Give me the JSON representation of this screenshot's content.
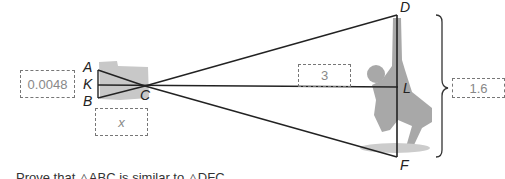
{
  "diagram": {
    "points": {
      "A": "A",
      "K": "K",
      "B": "B",
      "C": "C",
      "D": "D",
      "L": "L",
      "F": "F"
    },
    "measurements": {
      "ab_length": "0.0048",
      "kc_length": "x",
      "cl_length": "3",
      "df_length": "1.6"
    },
    "caption": "Prove that △ABC is similar to △DFC."
  }
}
